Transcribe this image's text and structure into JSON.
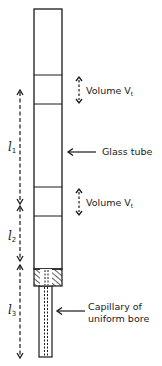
{
  "diagram": {
    "type": "apparatus",
    "colors": {
      "ink": "#1a1a1a",
      "background": "#ffffff"
    },
    "labels": {
      "volume_upper": {
        "text": "Volume V",
        "subscript": "t"
      },
      "glass_tube": "Glass tube",
      "volume_lower": {
        "text": "Volume V",
        "subscript": "t"
      },
      "capillary_line1": "Capillary of",
      "capillary_line2": "uniform bore"
    },
    "dimensions": [
      {
        "symbol": "l",
        "subscript": "1"
      },
      {
        "symbol": "l",
        "subscript": "2"
      },
      {
        "symbol": "l",
        "subscript": "3"
      }
    ],
    "components": [
      "glass-tube",
      "upper-volume-band",
      "lower-volume-band",
      "hatched-plug",
      "capillary"
    ]
  }
}
